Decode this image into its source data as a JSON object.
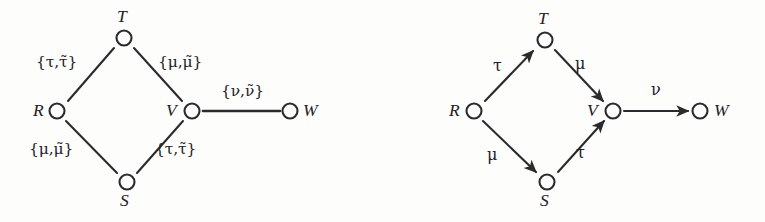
{
  "figure": {
    "background_color": "#fdfdfc",
    "ink_color": "#2b2b2e",
    "panels": [
      {
        "id": "left",
        "kind": "undirected-labeled-graph",
        "nodes": [
          {
            "id": "R",
            "label": "R",
            "x": 57,
            "y": 111,
            "label_x": 33,
            "label_y": 102,
            "label_pos": "left"
          },
          {
            "id": "T",
            "label": "T",
            "x": 124,
            "y": 38,
            "label_x": 117,
            "label_y": 8,
            "label_pos": "above"
          },
          {
            "id": "S",
            "label": "S",
            "x": 127,
            "y": 182,
            "label_x": 120,
            "label_y": 192,
            "label_pos": "below"
          },
          {
            "id": "V",
            "label": "V",
            "x": 192,
            "y": 111,
            "label_x": 166,
            "label_y": 102,
            "label_pos": "left"
          },
          {
            "id": "W",
            "label": "W",
            "x": 290,
            "y": 111,
            "label_x": 303,
            "label_y": 102,
            "label_pos": "right"
          }
        ],
        "edges": [
          {
            "from": "R",
            "to": "T",
            "label": "{τ,τ̃}",
            "label_x": 36,
            "label_y": 55,
            "directed": false
          },
          {
            "from": "T",
            "to": "V",
            "label": "{μ,μ̃}",
            "label_x": 158,
            "label_y": 55,
            "directed": false
          },
          {
            "from": "R",
            "to": "S",
            "label": "{μ,μ̃}",
            "label_x": 29,
            "label_y": 142,
            "directed": false
          },
          {
            "from": "S",
            "to": "V",
            "label": "{τ,τ̃}",
            "label_x": 155,
            "label_y": 142,
            "directed": false
          },
          {
            "from": "V",
            "to": "W",
            "label": "{ν,ν̃}",
            "label_x": 221,
            "label_y": 84,
            "directed": false
          }
        ]
      },
      {
        "id": "right",
        "kind": "directed-labeled-graph",
        "nodes": [
          {
            "id": "R",
            "label": "R",
            "x": 91,
            "y": 111,
            "label_x": 66,
            "label_y": 102,
            "label_pos": "left"
          },
          {
            "id": "T",
            "label": "T",
            "x": 162,
            "y": 40,
            "label_x": 155,
            "label_y": 10,
            "label_pos": "above"
          },
          {
            "id": "S",
            "label": "S",
            "x": 164,
            "y": 182,
            "label_x": 157,
            "label_y": 192,
            "label_pos": "below"
          },
          {
            "id": "V",
            "label": "V",
            "x": 230,
            "y": 111,
            "label_x": 204,
            "label_y": 102,
            "label_pos": "left"
          },
          {
            "id": "W",
            "label": "W",
            "x": 317,
            "y": 111,
            "label_x": 331,
            "label_y": 102,
            "label_pos": "right"
          }
        ],
        "edges": [
          {
            "from": "R",
            "to": "T",
            "label": "τ",
            "label_x": 110,
            "label_y": 58,
            "directed": true
          },
          {
            "from": "T",
            "to": "V",
            "label": "μ",
            "label_x": 192,
            "label_y": 56,
            "directed": true
          },
          {
            "from": "R",
            "to": "S",
            "label": "μ",
            "label_x": 104,
            "label_y": 147,
            "directed": true
          },
          {
            "from": "S",
            "to": "V",
            "label": "τ",
            "label_x": 193,
            "label_y": 145,
            "directed": true
          },
          {
            "from": "V",
            "to": "W",
            "label": "ν",
            "label_x": 268,
            "label_y": 82,
            "directed": true
          }
        ]
      }
    ]
  }
}
